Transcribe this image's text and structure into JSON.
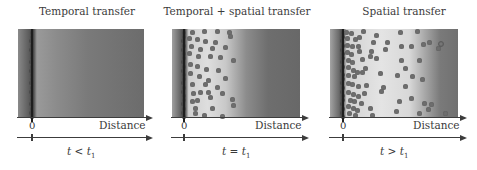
{
  "panels": [
    {
      "title": "Temporal transfer",
      "zero_label": "0",
      "distance_label": "Distance",
      "time_label": {
        "var": "t",
        "op": "<",
        "sub_var": "t",
        "sub": "1",
        "text": "t < t1"
      },
      "box": {
        "left": 18,
        "width": 126
      },
      "zero_x": 32,
      "gradient": "linear-gradient(to right, #8a8a8a 0%, #5a5a5a 9%, #3e3e3e 12%, #9a9a9a 15%, #8c8c8c 30%, #7a7a7a 55%, #6c6c6c 100%)",
      "dots": [],
      "wall_dots": true
    },
    {
      "title": "Temporal + spatial transfer",
      "zero_label": "0",
      "distance_label": "Distance",
      "time_label": {
        "var": "t",
        "op": "=",
        "sub_var": "t",
        "sub": "1",
        "text": "t = t1"
      },
      "box": {
        "left": 172,
        "width": 128
      },
      "zero_x": 184,
      "gradient": "linear-gradient(to right, #a0a0a0 0%, #606060 7%, #3c3c3c 10%, #d0d0d0 13%, #dedede 28%, #c8c8c8 42%, #8c8c8c 58%, #6e6e6e 75%, #686868 100%)",
      "dots": [
        [
          192,
          32
        ],
        [
          204,
          31
        ],
        [
          217,
          31
        ],
        [
          229,
          32
        ],
        [
          189,
          38
        ],
        [
          197,
          39
        ],
        [
          205,
          41
        ],
        [
          215,
          42
        ],
        [
          230,
          36
        ],
        [
          191,
          46
        ],
        [
          200,
          49
        ],
        [
          212,
          48
        ],
        [
          225,
          47
        ],
        [
          189,
          53
        ],
        [
          198,
          56
        ],
        [
          210,
          56
        ],
        [
          220,
          57
        ],
        [
          233,
          60
        ],
        [
          190,
          64
        ],
        [
          197,
          66
        ],
        [
          206,
          69
        ],
        [
          218,
          70
        ],
        [
          190,
          73
        ],
        [
          199,
          76
        ],
        [
          208,
          80
        ],
        [
          225,
          78
        ],
        [
          192,
          84
        ],
        [
          205,
          84
        ],
        [
          217,
          87
        ],
        [
          193,
          93
        ],
        [
          200,
          92
        ],
        [
          208,
          92
        ],
        [
          222,
          93
        ],
        [
          192,
          101
        ],
        [
          197,
          100
        ],
        [
          210,
          97
        ],
        [
          232,
          99
        ],
        [
          195,
          108
        ],
        [
          212,
          108
        ],
        [
          233,
          105
        ],
        [
          195,
          113
        ],
        [
          204,
          115
        ],
        [
          222,
          116
        ]
      ],
      "wall_dots": true
    },
    {
      "title": "Spatial transfer",
      "zero_label": "0",
      "distance_label": "Distance",
      "time_label": {
        "var": "t",
        "op": ">",
        "sub_var": "t",
        "sub": "1",
        "text": "t > t1"
      },
      "box": {
        "left": 330,
        "width": 128
      },
      "zero_x": 343,
      "gradient": "linear-gradient(to right, #a4a4a4 0%, #6a6a6a 7%, #404040 10%, #d2d2d2 13%, #e4e4e4 40%, #d8d8d8 62%, #a8a8a8 74%, #7a7a7a 86%, #707070 100%)",
      "dots": [
        [
          346,
          32
        ],
        [
          351,
          33
        ],
        [
          363,
          31
        ],
        [
          376,
          35
        ],
        [
          400,
          32
        ],
        [
          417,
          31
        ],
        [
          347,
          38
        ],
        [
          355,
          39
        ],
        [
          359,
          37
        ],
        [
          373,
          42
        ],
        [
          387,
          42
        ],
        [
          411,
          46
        ],
        [
          423,
          44
        ],
        [
          438,
          48
        ],
        [
          347,
          45
        ],
        [
          352,
          46
        ],
        [
          358,
          46
        ],
        [
          371,
          51
        ],
        [
          385,
          49
        ],
        [
          401,
          46
        ],
        [
          429,
          42
        ],
        [
          347,
          52
        ],
        [
          351,
          54
        ],
        [
          359,
          51
        ],
        [
          370,
          56
        ],
        [
          401,
          60
        ],
        [
          419,
          60
        ],
        [
          348,
          60
        ],
        [
          352,
          62
        ],
        [
          362,
          59
        ],
        [
          376,
          58
        ],
        [
          405,
          68
        ],
        [
          348,
          67
        ],
        [
          353,
          70
        ],
        [
          357,
          72
        ],
        [
          365,
          68
        ],
        [
          380,
          73
        ],
        [
          397,
          75
        ],
        [
          412,
          76
        ],
        [
          422,
          79
        ],
        [
          348,
          75
        ],
        [
          354,
          76
        ],
        [
          362,
          72
        ],
        [
          383,
          87
        ],
        [
          348,
          83
        ],
        [
          352,
          84
        ],
        [
          358,
          86
        ],
        [
          366,
          85
        ],
        [
          381,
          91
        ],
        [
          405,
          86
        ],
        [
          348,
          92
        ],
        [
          353,
          94
        ],
        [
          358,
          96
        ],
        [
          364,
          93
        ],
        [
          411,
          98
        ],
        [
          424,
          103
        ],
        [
          350,
          100
        ],
        [
          354,
          101
        ],
        [
          361,
          103
        ],
        [
          399,
          101
        ],
        [
          348,
          106
        ],
        [
          353,
          108
        ],
        [
          357,
          110
        ],
        [
          370,
          108
        ],
        [
          396,
          111
        ],
        [
          428,
          109
        ],
        [
          445,
          113
        ],
        [
          349,
          113
        ],
        [
          355,
          115
        ],
        [
          372,
          115
        ],
        [
          419,
          113
        ],
        [
          431,
          104
        ]
      ],
      "hollow_dots": [
        [
          441,
          44
        ]
      ],
      "wall_dots": true
    }
  ],
  "colors": {
    "axis": "#3c3c3c",
    "dot": "#6e6e6e",
    "wall": "#2e2e2e",
    "text": "#3a3a3a"
  }
}
